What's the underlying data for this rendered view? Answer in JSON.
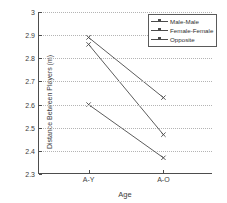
{
  "chart_data": {
    "type": "line",
    "title": "",
    "xlabel": "Age",
    "ylabel": "Distance Between Players (m)",
    "categories": [
      "A-Y",
      "A-O"
    ],
    "xtick_labels": [
      "A-Y",
      "A-O"
    ],
    "ytick_labels": [
      "2.3",
      "2.4",
      "2.5",
      "2.6",
      "2.7",
      "2.8",
      "2.9",
      "3"
    ],
    "ytick_values": [
      2.3,
      2.4,
      2.5,
      2.6,
      2.7,
      2.8,
      2.9,
      3.0
    ],
    "ylim": [
      2.3,
      3.0
    ],
    "grid": true,
    "grid_style": "dotted-horizontal",
    "legend_position": "top-right",
    "line_color": "#4a4a4a",
    "marker": "cross",
    "series": [
      {
        "name": "Male-Male",
        "values": [
          2.89,
          2.63
        ]
      },
      {
        "name": "Female-Female",
        "values": [
          2.6,
          2.37
        ]
      },
      {
        "name": "Opposite",
        "values": [
          2.86,
          2.47
        ]
      }
    ]
  },
  "legend": {
    "items": [
      {
        "label": "Male-Male"
      },
      {
        "label": "Female-Female"
      },
      {
        "label": "Opposite"
      }
    ]
  }
}
